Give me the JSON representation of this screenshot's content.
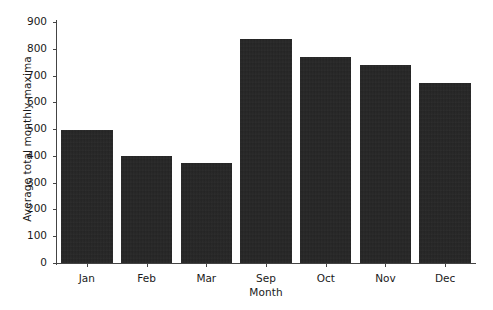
{
  "chart_data": {
    "type": "bar",
    "title": "",
    "xlabel": "Month",
    "ylabel": "Average total monthly maxima",
    "categories": [
      "Jan",
      "Feb",
      "Mar",
      "Sep",
      "Oct",
      "Nov",
      "Dec"
    ],
    "values": [
      495,
      400,
      375,
      838,
      770,
      740,
      672
    ],
    "ylim": [
      0,
      900
    ],
    "yticks": [
      0,
      100,
      200,
      300,
      400,
      500,
      600,
      700,
      800,
      900
    ],
    "ytick_labels": [
      "0",
      "100",
      "200",
      "300",
      "400",
      "500",
      "600",
      "700",
      "800",
      "900"
    ],
    "grid": false,
    "legend": null,
    "bar_color": "#262626",
    "axis_color": "#444444"
  }
}
